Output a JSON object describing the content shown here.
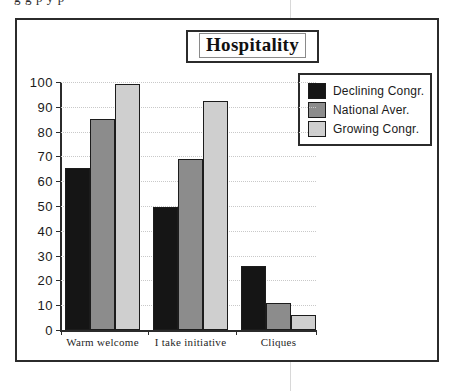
{
  "page": {
    "cropped_text_above": "g g p y p"
  },
  "chart_data": {
    "type": "bar",
    "title": "Hospitality",
    "xlabel": "",
    "ylabel": "",
    "ylim": [
      0,
      100
    ],
    "ytick_step": 10,
    "yticks": [
      100,
      90,
      80,
      70,
      60,
      50,
      40,
      30,
      20,
      10,
      0
    ],
    "grid": true,
    "legend_position": "right",
    "categories": [
      "Warm  welcome",
      "I take initiative",
      "Cliques"
    ],
    "series": [
      {
        "name": "Declining Congr.",
        "color": "#151515",
        "values": [
          65.5,
          49.5,
          25.8
        ]
      },
      {
        "name": "National  Aver.",
        "color": "#8c8c8c",
        "values": [
          85,
          68.8,
          11
        ]
      },
      {
        "name": "Growing Congr.",
        "color": "#cfcfcf",
        "values": [
          99,
          92.5,
          6.2
        ]
      }
    ]
  },
  "colors": {
    "frame": "#2b2b2b",
    "gridline": "#c9c9c9",
    "text": "#1a1a1a",
    "background": "#ffffff"
  }
}
